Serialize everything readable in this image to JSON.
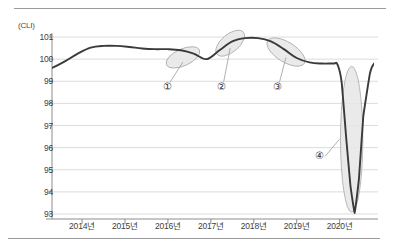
{
  "figure": {
    "name": "composite-leading-index-chart",
    "unit_label": "(CLI)",
    "line_color": "#3a3a3a",
    "grid_color": "#dcdcdc",
    "axis_color": "#8c8c8c",
    "highlight_fill": "#e6e6e6",
    "highlight_stroke": "#a8a8a8",
    "rule_color": "#9a9a9a"
  },
  "chart_data": {
    "type": "line",
    "title": "",
    "subtitle": "",
    "xlabel": "",
    "ylabel": "(CLI)",
    "ylim": [
      93,
      101
    ],
    "xlim": [
      2013.3,
      2020.8
    ],
    "grid": true,
    "legend": null,
    "ytick_labels": [
      "101",
      "100",
      "99",
      "98",
      "97",
      "96",
      "95",
      "94",
      "93"
    ],
    "ytick_values": [
      101,
      100,
      99,
      98,
      97,
      96,
      95,
      94,
      93
    ],
    "xtick_labels": [
      "2014년",
      "2015년",
      "2016년",
      "2017년",
      "2018년",
      "2019년",
      "2020년"
    ],
    "xtick_values": [
      2014,
      2015,
      2016,
      2017,
      2018,
      2019,
      2020
    ],
    "series": [
      {
        "name": "CLI",
        "x": [
          2013.3,
          2013.6,
          2013.9,
          2014.2,
          2014.5,
          2014.8,
          2015.1,
          2015.4,
          2015.7,
          2016.0,
          2016.3,
          2016.6,
          2016.9,
          2017.2,
          2017.5,
          2017.8,
          2018.1,
          2018.4,
          2018.7,
          2019.0,
          2019.3,
          2019.6,
          2019.85,
          2019.95,
          2020.05,
          2020.15,
          2020.25,
          2020.35,
          2020.45,
          2020.55,
          2020.7,
          2020.8
        ],
        "values": [
          99.6,
          99.9,
          100.25,
          100.52,
          100.6,
          100.6,
          100.55,
          100.48,
          100.45,
          100.45,
          100.4,
          100.25,
          100.0,
          100.4,
          100.8,
          100.95,
          100.95,
          100.8,
          100.45,
          100.05,
          99.85,
          99.8,
          99.8,
          99.75,
          98.9,
          96.5,
          94.3,
          93.05,
          94.6,
          97.4,
          99.3,
          99.8
        ]
      }
    ],
    "annotations": [
      {
        "id": "callout-1",
        "label": "①",
        "label_x": 2016.0,
        "label_y": 98.72,
        "highlight": {
          "cx": 2016.35,
          "cy": 100.08,
          "rx_years": 0.42,
          "ry_units": 0.38,
          "rotation_deg": -24
        }
      },
      {
        "id": "callout-2",
        "label": "②",
        "label_x": 2017.25,
        "label_y": 98.72,
        "highlight": {
          "cx": 2017.45,
          "cy": 100.72,
          "rx_years": 0.4,
          "ry_units": 0.4,
          "rotation_deg": -40
        }
      },
      {
        "id": "callout-3",
        "label": "③",
        "label_x": 2018.55,
        "label_y": 98.72,
        "highlight": {
          "cx": 2018.75,
          "cy": 100.32,
          "rx_years": 0.5,
          "ry_units": 0.45,
          "rotation_deg": 32
        }
      },
      {
        "id": "callout-4",
        "label": "④",
        "label_x": 2019.52,
        "label_y": 95.6,
        "highlight": {
          "cx": 2020.28,
          "cy": 96.38,
          "rx_years": 0.26,
          "ry_units": 3.3,
          "rotation_deg": 0
        }
      }
    ]
  }
}
